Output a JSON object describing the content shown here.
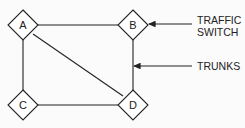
{
  "diagram": {
    "nodes": [
      {
        "id": "A",
        "label": "A"
      },
      {
        "id": "B",
        "label": "B"
      },
      {
        "id": "C",
        "label": "C"
      },
      {
        "id": "D",
        "label": "D"
      }
    ],
    "edges": [
      {
        "from": "A",
        "to": "B"
      },
      {
        "from": "A",
        "to": "C"
      },
      {
        "from": "A",
        "to": "D"
      },
      {
        "from": "B",
        "to": "D"
      },
      {
        "from": "C",
        "to": "D"
      }
    ],
    "callouts": [
      {
        "id": "traffic-switch",
        "lines": [
          "TRAFFIC",
          "SWITCH"
        ],
        "points_to": "node B"
      },
      {
        "id": "trunks",
        "lines": [
          "TRUNKS"
        ],
        "points_to": "edge B-D"
      }
    ]
  }
}
